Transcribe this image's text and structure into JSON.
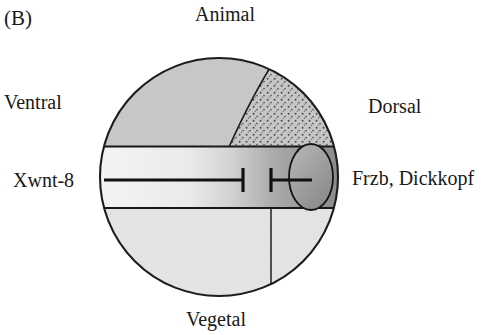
{
  "figure": {
    "panel_letter": "(B)",
    "caption_labels": {
      "animal": "Animal",
      "vegetal": "Vegetal",
      "ventral": "Ventral",
      "dorsal": "Dorsal"
    },
    "signal_labels": {
      "left_signal": "Xwnt-8",
      "right_signal": "Frzb, Dickkopf"
    }
  },
  "diagram": {
    "type": "xenopus-embryo-schematic",
    "embryo_circle": {
      "center_x": 219,
      "center_y": 177,
      "radius": 119
    },
    "regions": [
      {
        "name": "animal-cap",
        "label": "Animal cap",
        "fill": "#c9c9c9",
        "texture": "fine-stipple"
      },
      {
        "name": "dorsal-marginal-stipple",
        "label": "Dorsal stippled crescent",
        "fill": "#c4c4c4",
        "texture": "coarse-stipple"
      },
      {
        "name": "equatorial-band",
        "label": "Marginal zone band",
        "fill_left": "#f0f0f0",
        "fill_right": "#8e8e8e",
        "texture": "gradient"
      },
      {
        "name": "vegetal-mass",
        "label": "Vegetal hemisphere",
        "fill": "#e2e2e2",
        "texture": "fine-stipple"
      },
      {
        "name": "spemann-organizer",
        "label": "Organizer ellipse",
        "fill": "#9a9a9a",
        "texture": "gradient-ellipse",
        "center_x": 311,
        "center_y": 177,
        "rx": 22,
        "ry": 33
      }
    ],
    "arrows": [
      {
        "name": "xwnt8-inhibition-arrow",
        "direction": "ventral-to-dorsal",
        "terminus": "T-bar",
        "x_start": 104,
        "x_end": 243,
        "y": 180
      },
      {
        "name": "frzb-dickkopf-inhibition-arrow",
        "direction": "dorsal-to-ventral",
        "terminus": "T-bar",
        "x_start": 310,
        "x_end": 271,
        "y": 180
      }
    ],
    "internal_lines": [
      {
        "name": "band-top-line",
        "y": 146
      },
      {
        "name": "band-bottom-line",
        "y": 208
      },
      {
        "name": "vegetal-vertical-line",
        "x": 271,
        "y_start": 208,
        "y_end": 292
      }
    ],
    "colors": {
      "outline": "#1c1c1c",
      "animal_cap": "#c9c9c9",
      "stipple_crescent": "#c4c4c4",
      "band_light": "#f0f0f0",
      "band_dark": "#8e8e8e",
      "vegetal": "#e2e2e2",
      "organizer": "#9a9a9a",
      "background": "#ffffff"
    }
  }
}
